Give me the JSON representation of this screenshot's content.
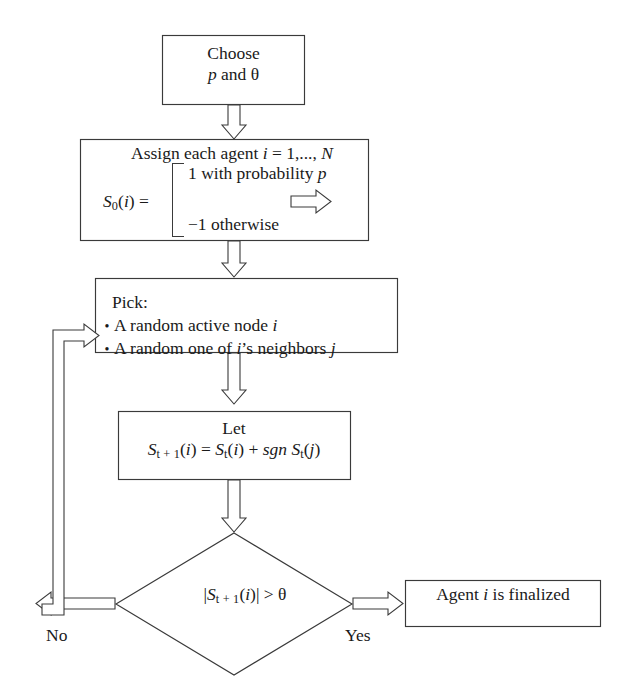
{
  "diagram": {
    "background_color": "#ffffff",
    "line_color": "#3a3a3a",
    "text_color": "#1a1a1a"
  },
  "nodes": {
    "choose": {
      "shape": "rectangle",
      "line1": "Choose",
      "line2_prefix": "",
      "line2_var": "p",
      "line2_mid": " and ",
      "line2_theta": "θ"
    },
    "assign": {
      "shape": "rectangle",
      "header_prefix": "Assign each agent ",
      "header_index": "i",
      "header_eq": " = 1,..., ",
      "header_n": "N",
      "lhs_s": "S",
      "lhs_sub": "0",
      "lhs_rest": "(",
      "lhs_i": "i",
      "lhs_close": ") =",
      "case_true_prefix": "1 with probability ",
      "case_true_var": "p",
      "case_false": "−1 otherwise",
      "inline_arrow": "rightwards-hollow-arrow"
    },
    "pick": {
      "shape": "rectangle",
      "heading": "Pick:",
      "items": [
        {
          "prefix": "A random active node ",
          "var": "i",
          "suffix": ""
        },
        {
          "prefix": "A random one of ",
          "var": "i",
          "mid": "’s neighbors ",
          "var2": "j",
          "suffix": ""
        }
      ]
    },
    "let": {
      "shape": "rectangle",
      "line1": "Let",
      "eq_s1": "S",
      "eq_sub1": "t + 1",
      "eq_open1": "(",
      "eq_i1": "i",
      "eq_close1": ") = ",
      "eq_s2": "S",
      "eq_sub2": "t",
      "eq_open2": "(",
      "eq_i2": "i",
      "eq_close2": ") + ",
      "eq_sgn": "sgn",
      "eq_s3": " S",
      "eq_sub3": "t",
      "eq_open3": "(",
      "eq_j": "j",
      "eq_close3": ")"
    },
    "decision": {
      "shape": "diamond",
      "bar_open": "|",
      "s": "S",
      "sub": "t + 1",
      "open": "(",
      "i": "i",
      "close": ")",
      "bar_close": "|",
      "op": " > ",
      "theta": "θ"
    },
    "final": {
      "shape": "rectangle",
      "prefix": "Agent ",
      "var": "i",
      "suffix": " is finalized"
    }
  },
  "edges": {
    "choose_to_assign": {
      "label": "",
      "style": "hollow-down-arrow"
    },
    "assign_to_pick": {
      "label": "",
      "style": "hollow-down-arrow"
    },
    "pick_to_let": {
      "label": "",
      "style": "hollow-down-arrow"
    },
    "let_to_decision": {
      "label": "",
      "style": "hollow-down-arrow"
    },
    "decision_no": {
      "label": "No",
      "style": "hollow-left-then-up-arrow",
      "target": "pick"
    },
    "decision_yes": {
      "label": "Yes",
      "style": "hollow-right-arrow",
      "target": "final"
    }
  }
}
